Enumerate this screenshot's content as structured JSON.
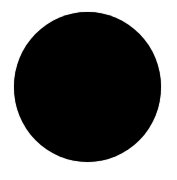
{
  "shape": {
    "type": "circle",
    "fill": "#000000",
    "background": "#ffffff"
  }
}
